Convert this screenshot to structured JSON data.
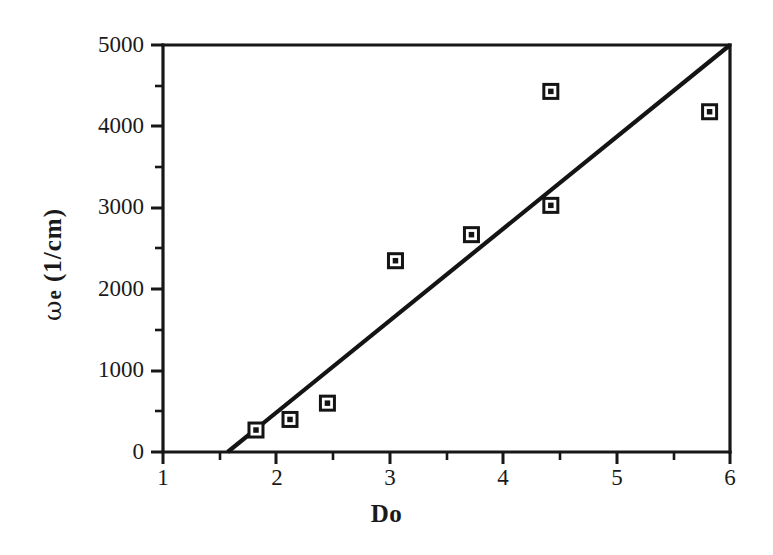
{
  "figure": {
    "background_color": "#ffffff",
    "ink_color": "#141414"
  },
  "axes": {
    "x_label": "Do",
    "y_label_symbol": "ω",
    "y_label_subscript": "e",
    "y_label_unit": "(1/cm)",
    "y_label_full": "ω e (1/cm)",
    "x_ticks": [
      "1",
      "2",
      "3",
      "4",
      "5",
      "6"
    ],
    "y_ticks": [
      "0",
      "1000",
      "2000",
      "3000",
      "4000",
      "5000"
    ]
  },
  "chart_data": {
    "type": "scatter",
    "title": "",
    "xlabel": "Do",
    "ylabel": "ω e (1/cm)",
    "xlim": [
      1,
      6
    ],
    "ylim": [
      0,
      5000
    ],
    "xticks": [
      1,
      2,
      3,
      4,
      5,
      6
    ],
    "yticks": [
      0,
      1000,
      2000,
      3000,
      4000,
      5000
    ],
    "x_minor_tick_step": 0.5,
    "y_minor_tick_step": 500,
    "grid": false,
    "legend": null,
    "marker_style": "open-square-with-center-dot",
    "series": [
      {
        "name": "data",
        "type": "scatter",
        "points": [
          {
            "x": 1.82,
            "y": 270
          },
          {
            "x": 2.12,
            "y": 400
          },
          {
            "x": 2.45,
            "y": 600
          },
          {
            "x": 3.05,
            "y": 2350
          },
          {
            "x": 3.72,
            "y": 2670
          },
          {
            "x": 4.42,
            "y": 3030
          },
          {
            "x": 4.42,
            "y": 4430
          },
          {
            "x": 5.82,
            "y": 4180
          }
        ]
      },
      {
        "name": "trend line",
        "type": "line",
        "endpoints": [
          {
            "x": 1.57,
            "y": 0
          },
          {
            "x": 6.0,
            "y": 5000
          }
        ],
        "slope": 1128.7,
        "x_intercept": 1.57
      }
    ]
  }
}
